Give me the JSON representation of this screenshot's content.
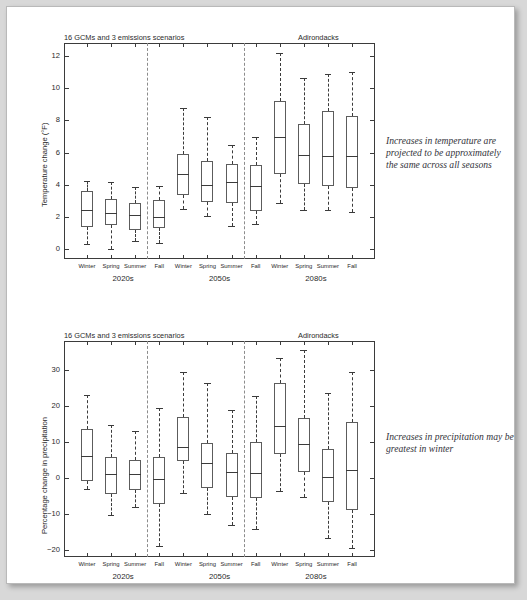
{
  "document": {
    "background_color": "#d8d8d8",
    "page_color": "#ffffff"
  },
  "panels": [
    {
      "id": "temperature",
      "supertitle_left": "16 GCMs and 3 emissions scenarios",
      "supertitle_right": "Adirondacks",
      "ylabel": "Temperature change (°F)",
      "group_labels": [
        "2020s",
        "2050s",
        "2080s"
      ],
      "season_labels": [
        "Winter",
        "Spring",
        "Summer",
        "Fall"
      ],
      "sidenote": "Increases in temperature are projected to be approximately the same across all seasons"
    },
    {
      "id": "precipitation",
      "supertitle_left": "16 GCMs and 3 emissions scenarios",
      "supertitle_right": "Adirondacks",
      "ylabel": "Percentage change in precipitation",
      "group_labels": [
        "2020s",
        "2050s",
        "2080s"
      ],
      "season_labels": [
        "Winter",
        "Spring",
        "Summer",
        "Fall"
      ],
      "sidenote": "Increases in precipitation may be greatest in winter"
    }
  ],
  "chart_data": [
    {
      "type": "box",
      "id": "temperature-change-boxplot",
      "title": "16 GCMs and 3 emissions scenarios",
      "title_right": "Adirondacks",
      "xlabel": "",
      "ylabel": "Temperature change (°F)",
      "ylim": [
        -0.6,
        12.8
      ],
      "yticks": [
        0,
        2,
        4,
        6,
        8,
        10,
        12
      ],
      "ytick_labels": [
        "0",
        "2",
        "4",
        "6",
        "8",
        "10",
        "12"
      ],
      "grid": false,
      "legend": "none",
      "groups": [
        "2020s",
        "2050s",
        "2080s"
      ],
      "categories": [
        "2020s Winter",
        "2020s Spring",
        "2020s Summer",
        "2020s Fall",
        "2050s Winter",
        "2050s Spring",
        "2050s Summer",
        "2050s Fall",
        "2080s Winter",
        "2080s Spring",
        "2080s Summer",
        "2080s Fall"
      ],
      "boxes": [
        {
          "label": "Winter",
          "group": "2020s",
          "whisker_low": 0.3,
          "q1": 1.4,
          "median": 2.45,
          "q3": 3.6,
          "whisker_high": 4.25
        },
        {
          "label": "Spring",
          "group": "2020s",
          "whisker_low": 0.0,
          "q1": 1.5,
          "median": 2.25,
          "q3": 3.15,
          "whisker_high": 4.2
        },
        {
          "label": "Summer",
          "group": "2020s",
          "whisker_low": 0.5,
          "q1": 1.2,
          "median": 2.1,
          "q3": 2.9,
          "whisker_high": 3.85
        },
        {
          "label": "Fall",
          "group": "2020s",
          "whisker_low": 0.4,
          "q1": 1.3,
          "median": 2.0,
          "q3": 3.05,
          "whisker_high": 3.9
        },
        {
          "label": "Winter",
          "group": "2050s",
          "whisker_low": 2.5,
          "q1": 3.4,
          "median": 4.65,
          "q3": 5.9,
          "whisker_high": 8.75
        },
        {
          "label": "Spring",
          "group": "2050s",
          "whisker_low": 2.05,
          "q1": 2.95,
          "median": 4.0,
          "q3": 5.5,
          "whisker_high": 8.2
        },
        {
          "label": "Summer",
          "group": "2050s",
          "whisker_low": 1.45,
          "q1": 2.85,
          "median": 4.15,
          "q3": 5.3,
          "whisker_high": 6.45
        },
        {
          "label": "Fall",
          "group": "2050s",
          "whisker_low": 1.6,
          "q1": 2.4,
          "median": 3.95,
          "q3": 5.25,
          "whisker_high": 6.95
        },
        {
          "label": "Winter",
          "group": "2080s",
          "whisker_low": 2.9,
          "q1": 4.7,
          "median": 6.95,
          "q3": 9.2,
          "whisker_high": 12.2
        },
        {
          "label": "Spring",
          "group": "2080s",
          "whisker_low": 2.45,
          "q1": 4.05,
          "median": 5.85,
          "q3": 7.8,
          "whisker_high": 10.65
        },
        {
          "label": "Summer",
          "group": "2080s",
          "whisker_low": 2.45,
          "q1": 3.9,
          "median": 5.8,
          "q3": 8.6,
          "whisker_high": 10.9
        },
        {
          "label": "Fall",
          "group": "2080s",
          "whisker_low": 2.3,
          "q1": 3.8,
          "median": 5.8,
          "q3": 8.3,
          "whisker_high": 11.0
        }
      ]
    },
    {
      "type": "box",
      "id": "precipitation-change-boxplot",
      "title": "16 GCMs and 3 emissions scenarios",
      "title_right": "Adirondacks",
      "xlabel": "",
      "ylabel": "Percentage change in precipitation",
      "ylim": [
        -22,
        38
      ],
      "yticks": [
        -20,
        -10,
        0,
        10,
        20,
        30
      ],
      "ytick_labels": [
        "−20",
        "−10",
        "0",
        "10",
        "20",
        "30"
      ],
      "grid": false,
      "legend": "none",
      "groups": [
        "2020s",
        "2050s",
        "2080s"
      ],
      "categories": [
        "2020s Winter",
        "2020s Spring",
        "2020s Summer",
        "2020s Fall",
        "2050s Winter",
        "2050s Spring",
        "2050s Summer",
        "2050s Fall",
        "2080s Winter",
        "2080s Spring",
        "2080s Summer",
        "2080s Fall"
      ],
      "boxes": [
        {
          "label": "Winter",
          "group": "2020s",
          "whisker_low": -3.1,
          "q1": -0.9,
          "median": 6.1,
          "q3": 13.6,
          "whisker_high": 22.9
        },
        {
          "label": "Spring",
          "group": "2020s",
          "whisker_low": -10.2,
          "q1": -4.6,
          "median": 1.0,
          "q3": 5.8,
          "whisker_high": 14.6
        },
        {
          "label": "Summer",
          "group": "2020s",
          "whisker_low": -8.0,
          "q1": -3.5,
          "median": 1.1,
          "q3": 5.0,
          "whisker_high": 13.0
        },
        {
          "label": "Fall",
          "group": "2020s",
          "whisker_low": -18.9,
          "q1": -7.4,
          "median": -0.2,
          "q3": 5.9,
          "whisker_high": 19.5
        },
        {
          "label": "Winter",
          "group": "2050s",
          "whisker_low": -4.2,
          "q1": 4.6,
          "median": 8.5,
          "q3": 16.8,
          "whisker_high": 29.3
        },
        {
          "label": "Spring",
          "group": "2050s",
          "whisker_low": -10.1,
          "q1": -2.9,
          "median": 4.0,
          "q3": 9.8,
          "whisker_high": 26.3
        },
        {
          "label": "Summer",
          "group": "2050s",
          "whisker_low": -13.0,
          "q1": -5.4,
          "median": 1.5,
          "q3": 7.0,
          "whisker_high": 18.7
        },
        {
          "label": "Fall",
          "group": "2050s",
          "whisker_low": -14.2,
          "q1": -5.6,
          "median": 1.3,
          "q3": 9.9,
          "whisker_high": 22.6
        },
        {
          "label": "Winter",
          "group": "2080s",
          "whisker_low": -3.6,
          "q1": 6.5,
          "median": 14.4,
          "q3": 26.4,
          "whisker_high": 33.3
        },
        {
          "label": "Spring",
          "group": "2080s",
          "whisker_low": -5.4,
          "q1": 1.6,
          "median": 9.5,
          "q3": 16.7,
          "whisker_high": 35.6
        },
        {
          "label": "Summer",
          "group": "2080s",
          "whisker_low": -16.7,
          "q1": -6.7,
          "median": 0.2,
          "q3": 8.0,
          "whisker_high": 23.5
        },
        {
          "label": "Fall",
          "group": "2080s",
          "whisker_low": -19.4,
          "q1": -9.0,
          "median": 2.2,
          "q3": 15.4,
          "whisker_high": 29.3
        }
      ]
    }
  ]
}
